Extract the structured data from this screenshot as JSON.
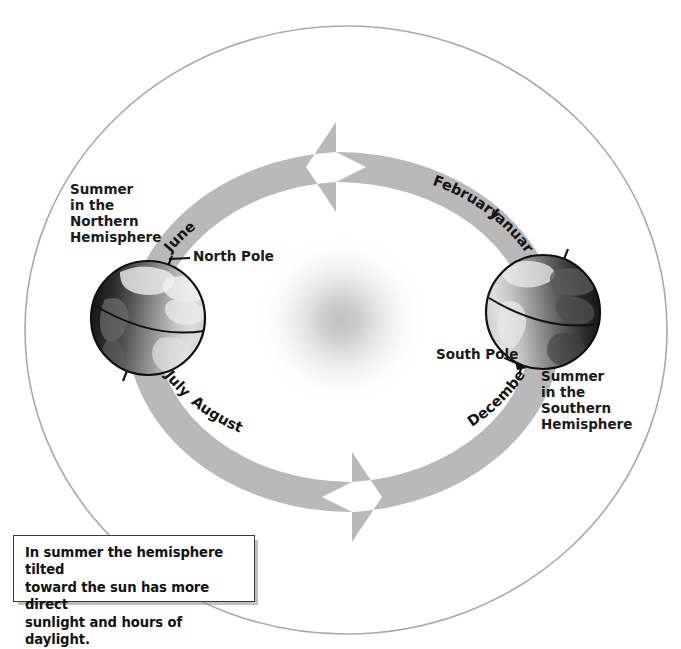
{
  "figure": {
    "type": "seasons-orbit-diagram",
    "orbit_direction": "counterclockwise"
  },
  "labels": {
    "summer_northern": "Summer\nin the\nNorthern\nHemisphere",
    "summer_southern": "Summer\nin the\nSouthern\nHemisphere",
    "north_pole": "North Pole",
    "south_pole": "South Pole"
  },
  "months": {
    "june": "June",
    "july": "July",
    "august": "August",
    "december": "December",
    "january": "January",
    "february": "February"
  },
  "caption": {
    "text": "In summer the hemisphere tilted\ntoward the sun has more direct\nsunlight and hours of daylight."
  },
  "objects": {
    "sun": "sun-glow",
    "earth_left": "earth-globe-northern-summer",
    "earth_right": "earth-globe-southern-summer",
    "orbit_path": "orbit-ellipse",
    "orbit_band": "orbit-arrow-band"
  },
  "colors": {
    "orbit_band": "#b9b9b9",
    "orbit_outline": "#a9a9a9",
    "sun_glow": "#c9c9c9",
    "text": "#1a1a1a",
    "globe_dark": "#1d1d1d",
    "globe_light": "#e4e4e4",
    "caption_border": "#3a3a3a",
    "background": "#ffffff"
  }
}
